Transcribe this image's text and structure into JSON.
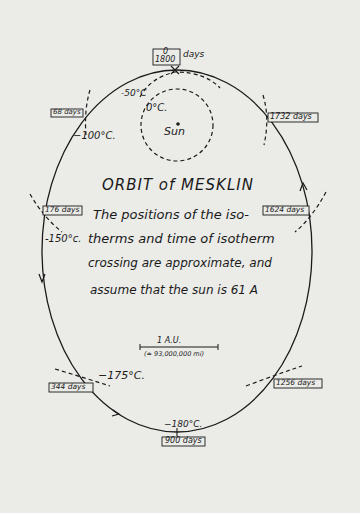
{
  "diagram": {
    "title": "ORBIT of MESKLIN",
    "note_lines": [
      "The positions of the iso-",
      "therms and time of isotherm",
      "crossing are approximate, and",
      "assume that the sun is 61 A"
    ],
    "sun_label": "Sun",
    "scale_bar": {
      "label": "1  A.U.",
      "sublabel": "(≐ 93,000,000 mi)"
    },
    "time_markers": [
      {
        "label_top": "0",
        "label_bottom": "1800",
        "suffix": "days"
      },
      {
        "label": "68 days"
      },
      {
        "label": "1732 days"
      },
      {
        "label": "176 days"
      },
      {
        "label": "1624 days"
      },
      {
        "label": "344 days"
      },
      {
        "label": "1256 days"
      },
      {
        "label": "900 days"
      }
    ],
    "isotherms": [
      {
        "label": "0°C."
      },
      {
        "label": "-50°C"
      },
      {
        "label": "−100°C."
      },
      {
        "label": "-150°c."
      },
      {
        "label": "−175°C."
      },
      {
        "label": "−180°C."
      }
    ],
    "colors": {
      "paper": "#ebebe8",
      "ink": "#1a1a1a"
    }
  }
}
